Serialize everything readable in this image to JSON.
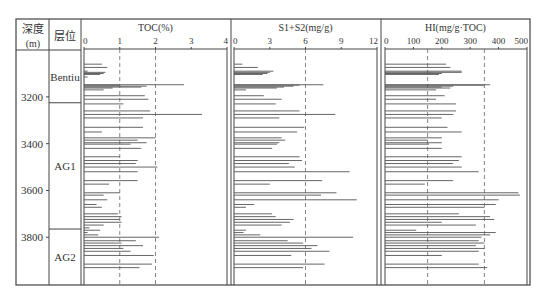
{
  "header": {
    "depth_label": "深度",
    "depth_unit": "(m)",
    "layer_label": "层位"
  },
  "layers": [
    {
      "name": "Bentiu",
      "top": 3008,
      "bottom": 3225
    },
    {
      "name": "AG1",
      "top": 3225,
      "bottom": 3765
    },
    {
      "name": "AG2",
      "top": 3765,
      "bottom": 4000
    }
  ],
  "depth_ticks": [
    3200,
    3400,
    3600,
    3800
  ],
  "chart_data": [
    {
      "type": "bar",
      "orientation": "horizontal",
      "title": "TOC(%)",
      "xlabel": "TOC(%)",
      "ylabel": "深度(m)",
      "xlim": [
        0,
        4
      ],
      "xticks": [
        0,
        1,
        2,
        3,
        4
      ],
      "reference_lines": [
        1,
        2
      ],
      "depth": [
        3060,
        3074,
        3090,
        3095,
        3100,
        3104,
        3115,
        3148,
        3150,
        3154,
        3158,
        3162,
        3170,
        3195,
        3210,
        3230,
        3260,
        3275,
        3290,
        3330,
        3350,
        3375,
        3385,
        3396,
        3402,
        3420,
        3456,
        3472,
        3485,
        3500,
        3520,
        3558,
        3573,
        3610,
        3620,
        3640,
        3660,
        3672,
        3700,
        3712,
        3724,
        3736,
        3748,
        3760,
        3770,
        3780,
        3790,
        3800,
        3815,
        3825,
        3836,
        3848,
        3860,
        3878,
        3915,
        3930
      ],
      "values": [
        0.5,
        0.65,
        0.1,
        0.6,
        0.55,
        0.45,
        0.1,
        2.8,
        1.0,
        1.75,
        1.6,
        0.8,
        0.55,
        1.7,
        1.8,
        1.1,
        1.85,
        3.3,
        1.65,
        1.65,
        0.5,
        2.0,
        1.5,
        1.75,
        1.3,
        1.6,
        1.0,
        1.5,
        1.45,
        2.05,
        1.5,
        1.5,
        0.7,
        1.0,
        0.55,
        0.65,
        0.35,
        0.5,
        0.95,
        1.05,
        1.0,
        1.05,
        0.55,
        0.15,
        0.45,
        0.1,
        0.4,
        2.1,
        1.45,
        1.05,
        1.65,
        1.1,
        1.3,
        1.95,
        1.9,
        1.55
      ]
    },
    {
      "type": "bar",
      "orientation": "horizontal",
      "title": "S1+S2(mg/g)",
      "xlabel": "S1+S2(mg/g)",
      "ylabel": "深度(m)",
      "xlim": [
        0,
        12
      ],
      "xticks": [
        0,
        3,
        6,
        9,
        12
      ],
      "reference_lines": [
        6
      ],
      "depth": [
        3060,
        3074,
        3090,
        3095,
        3100,
        3104,
        3148,
        3150,
        3154,
        3158,
        3162,
        3170,
        3195,
        3210,
        3230,
        3260,
        3275,
        3290,
        3330,
        3350,
        3375,
        3385,
        3396,
        3402,
        3420,
        3456,
        3472,
        3485,
        3500,
        3520,
        3558,
        3573,
        3610,
        3620,
        3640,
        3660,
        3672,
        3700,
        3712,
        3724,
        3736,
        3748,
        3770,
        3780,
        3790,
        3800,
        3815,
        3825,
        3836,
        3848,
        3860,
        3878,
        3915,
        3930
      ],
      "values": [
        0.7,
        2.0,
        3.3,
        3.0,
        2.8,
        2.4,
        7.5,
        5.5,
        5.0,
        4.2,
        3.6,
        1.0,
        2.5,
        4.0,
        3.5,
        5.5,
        8.5,
        3.8,
        5.9,
        5.3,
        4.0,
        4.3,
        3.8,
        3.6,
        3.2,
        5.5,
        5.7,
        4.6,
        5.1,
        9.7,
        7.4,
        3.0,
        8.6,
        7.3,
        10.3,
        1.7,
        1.0,
        3.2,
        3.5,
        5.0,
        4.7,
        4.0,
        1.0,
        0.8,
        2.2,
        10.0,
        4.5,
        5.8,
        7.0,
        6.5,
        8.0,
        4.8,
        7.6,
        5.8
      ]
    },
    {
      "type": "bar",
      "orientation": "horizontal",
      "title": "HI(mg/g·TOC)",
      "xlabel": "HI(mg/g·TOC)",
      "ylabel": "深度(m)",
      "xlim": [
        0,
        500
      ],
      "xticks": [
        0,
        100,
        200,
        300,
        400,
        500
      ],
      "reference_lines": [
        150,
        350
      ],
      "depth": [
        3060,
        3074,
        3090,
        3095,
        3100,
        3104,
        3148,
        3150,
        3154,
        3158,
        3162,
        3170,
        3195,
        3210,
        3230,
        3260,
        3275,
        3290,
        3330,
        3350,
        3375,
        3385,
        3396,
        3402,
        3420,
        3456,
        3472,
        3485,
        3500,
        3520,
        3558,
        3573,
        3610,
        3620,
        3640,
        3660,
        3672,
        3700,
        3712,
        3724,
        3736,
        3748,
        3770,
        3780,
        3790,
        3800,
        3815,
        3825,
        3836,
        3848,
        3860,
        3878,
        3915,
        3930
      ],
      "values": [
        215,
        230,
        270,
        270,
        200,
        190,
        370,
        350,
        240,
        200,
        230,
        180,
        210,
        180,
        250,
        250,
        240,
        200,
        220,
        270,
        200,
        150,
        200,
        155,
        200,
        270,
        260,
        240,
        270,
        330,
        240,
        140,
        470,
        475,
        400,
        390,
        350,
        260,
        370,
        385,
        200,
        320,
        110,
        390,
        370,
        340,
        330,
        350,
        320,
        350,
        330,
        200,
        330,
        360
      ]
    }
  ]
}
